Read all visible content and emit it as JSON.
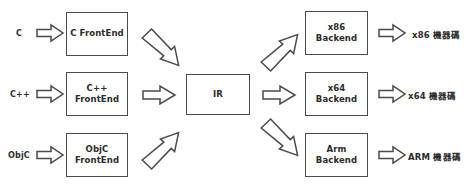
{
  "diagram": {
    "colors": {
      "stroke": "#4a4a4a",
      "text": "#2b2b2b",
      "background": "#ffffff"
    },
    "inputs": [
      {
        "label": "C"
      },
      {
        "label": "C++"
      },
      {
        "label": "ObjC"
      }
    ],
    "frontends": [
      {
        "label": "C FrontEnd"
      },
      {
        "label": "C++\nFrontEnd"
      },
      {
        "label": "ObjC\nFrontEnd"
      }
    ],
    "ir": {
      "label": "IR"
    },
    "backends": [
      {
        "label": "x86\nBackend"
      },
      {
        "label": "x64\nBackend"
      },
      {
        "label": "Arm\nBackend"
      }
    ],
    "outputs": [
      {
        "label": "x86 機器碼"
      },
      {
        "label": "x64 機器碼"
      },
      {
        "label": "ARM 機器碼"
      }
    ],
    "arrows": [
      {
        "name": "input-c-to-frontend",
        "direction": "right"
      },
      {
        "name": "input-cpp-to-frontend",
        "direction": "right"
      },
      {
        "name": "input-objc-to-frontend",
        "direction": "right"
      },
      {
        "name": "frontend-c-to-ir",
        "direction": "down-right"
      },
      {
        "name": "frontend-cpp-to-ir",
        "direction": "right"
      },
      {
        "name": "frontend-objc-to-ir",
        "direction": "up-right"
      },
      {
        "name": "ir-to-backend-x86",
        "direction": "up-right"
      },
      {
        "name": "ir-to-backend-x64",
        "direction": "right"
      },
      {
        "name": "ir-to-backend-arm",
        "direction": "down-right"
      },
      {
        "name": "backend-x86-to-output",
        "direction": "right"
      },
      {
        "name": "backend-x64-to-output",
        "direction": "right"
      },
      {
        "name": "backend-arm-to-output",
        "direction": "right"
      }
    ]
  }
}
